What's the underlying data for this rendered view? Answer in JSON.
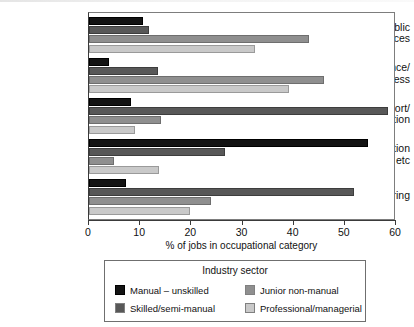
{
  "chart_data": {
    "type": "bar",
    "orientation": "horizontal",
    "title": "",
    "xlabel": "% of jobs in occupational category",
    "ylabel": "",
    "xlim": [
      0,
      60
    ],
    "xticks": [
      0,
      10,
      20,
      30,
      40,
      50,
      60
    ],
    "grid": false,
    "legend_position": "bottom",
    "legend_title": "Industry sector",
    "categories": [
      "Public services",
      "Finance/ business",
      "Transport/ communication",
      "Distribution etc",
      "Manufacturing"
    ],
    "category_lines": [
      [
        "Public",
        "services"
      ],
      [
        "Finance/",
        "business"
      ],
      [
        "Transport/",
        "communication"
      ],
      [
        "Distribution",
        "etc"
      ],
      [
        "Manufacturing"
      ]
    ],
    "series": [
      {
        "name": "Manual – unskilled",
        "color": "#131313",
        "values": [
          10.5,
          4.0,
          8.3,
          54.5,
          7.3
        ]
      },
      {
        "name": "Skilled/semi-manual",
        "color": "#585858",
        "values": [
          11.8,
          13.5,
          58.5,
          26.5,
          51.7
        ]
      },
      {
        "name": "Junior non-manual",
        "color": "#8f8f8f",
        "values": [
          43.0,
          46.0,
          14.0,
          4.9,
          23.8
        ]
      },
      {
        "name": "Professional/managerial",
        "color": "#c9c9c9",
        "values": [
          32.5,
          39.0,
          9.0,
          13.6,
          19.7
        ]
      }
    ]
  }
}
